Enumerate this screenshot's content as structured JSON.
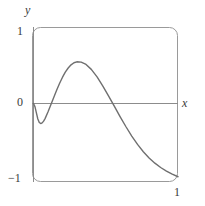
{
  "figure": {
    "kind": "function-graph",
    "background": "#ffffff",
    "frame": {
      "name": "calculator-viewport",
      "x": 32,
      "y": 27,
      "width": 146,
      "height": 155,
      "corner_radius": 8,
      "stroke": "#9a9a9a",
      "stroke_width": 1
    }
  },
  "labels": {
    "y_axis": "y",
    "x_axis": "x",
    "y_max": "1",
    "y_zero": "0",
    "y_min": "−1",
    "x_max": "1"
  },
  "chart_data": {
    "type": "line",
    "title": "",
    "xlabel": "x",
    "ylabel": "y",
    "xlim": [
      0,
      1
    ],
    "ylim": [
      -1,
      1
    ],
    "grid": false,
    "legend": null,
    "axis_color": "#8c8c8c",
    "curve_color": "#6f6f6f",
    "curve_width": 1.4,
    "xticks": [
      0,
      1
    ],
    "xticklabels": [
      "0",
      "1"
    ],
    "yticks": [
      -1,
      0,
      1
    ],
    "yticklabels": [
      "−1",
      "0",
      "1"
    ],
    "annotations": [],
    "series": [
      {
        "name": "curve",
        "x": [
          0.0,
          0.01,
          0.02,
          0.03,
          0.04,
          0.05,
          0.06,
          0.07,
          0.08,
          0.1,
          0.12,
          0.14,
          0.16,
          0.18,
          0.2,
          0.22,
          0.24,
          0.26,
          0.28,
          0.3,
          0.33,
          0.36,
          0.4,
          0.44,
          0.48,
          0.52,
          0.56,
          0.6,
          0.64,
          0.68,
          0.72,
          0.76,
          0.8,
          0.84,
          0.88,
          0.92,
          0.96,
          1.0
        ],
        "y": [
          0.0,
          -0.04,
          -0.12,
          -0.2,
          -0.245,
          -0.258,
          -0.25,
          -0.228,
          -0.195,
          -0.11,
          -0.015,
          0.08,
          0.175,
          0.265,
          0.345,
          0.415,
          0.47,
          0.512,
          0.54,
          0.552,
          0.548,
          0.522,
          0.452,
          0.352,
          0.23,
          0.098,
          -0.038,
          -0.172,
          -0.3,
          -0.42,
          -0.528,
          -0.622,
          -0.702,
          -0.77,
          -0.826,
          -0.872,
          -0.912,
          -0.945
        ]
      }
    ]
  }
}
